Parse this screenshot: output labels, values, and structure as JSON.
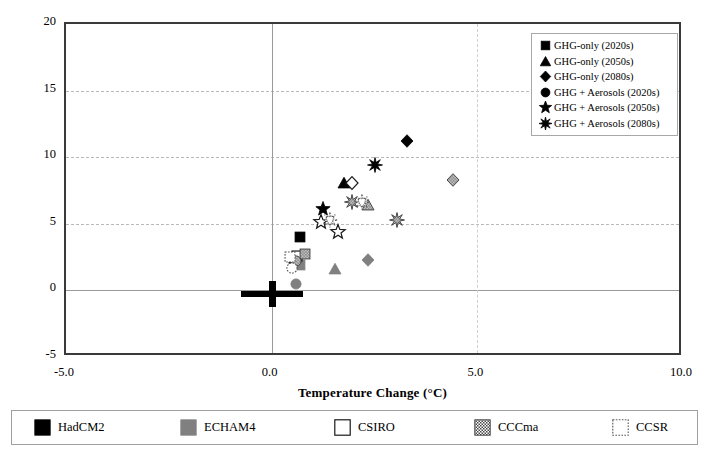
{
  "chart_data": {
    "type": "scatter",
    "title": "",
    "xlabel": "Temperature Change (°C)",
    "ylabel": "Precipitation Change (%)",
    "xlim": [
      -5.0,
      10.0
    ],
    "ylim": [
      -5,
      20
    ],
    "xticks": [
      "-5.0",
      "0.0",
      "5.0",
      "10.0"
    ],
    "xtick_values": [
      -5.0,
      0.0,
      5.0,
      10.0
    ],
    "yticks": [
      "-5",
      "0",
      "5",
      "10",
      "15",
      "20"
    ],
    "ytick_values": [
      -5,
      0,
      5,
      10,
      15,
      20
    ],
    "grid": "dashed horizontal and vertical gridlines",
    "legend_position": "inside top-right",
    "baseline_marker": {
      "label": "baseline cross",
      "x": 0.0,
      "y": -0.3
    },
    "points": [
      {
        "model": "HadCM2",
        "scenario": "GHG-only (2020s)",
        "marker": "square",
        "fill": "black",
        "x": 0.7,
        "y": 4.0
      },
      {
        "model": "HadCM2",
        "scenario": "GHG-only (2050s)",
        "marker": "triangle",
        "fill": "black",
        "x": 1.75,
        "y": 8.1
      },
      {
        "model": "HadCM2",
        "scenario": "GHG-only (2080s)",
        "marker": "diamond",
        "fill": "black",
        "x": 3.3,
        "y": 11.2
      },
      {
        "model": "HadCM2",
        "scenario": "GHG + Aerosols (2020s)",
        "marker": "circle",
        "fill": "black",
        "x": 0.55,
        "y": 2.1
      },
      {
        "model": "HadCM2",
        "scenario": "GHG + Aerosols (2050s)",
        "marker": "star5",
        "fill": "black",
        "x": 1.25,
        "y": 6.1
      },
      {
        "model": "HadCM2",
        "scenario": "GHG + Aerosols (2080s)",
        "marker": "star8",
        "fill": "black",
        "x": 2.5,
        "y": 9.4
      },
      {
        "model": "ECHAM4",
        "scenario": "GHG-only (2020s)",
        "marker": "square",
        "fill": "gray",
        "x": 0.68,
        "y": 1.9
      },
      {
        "model": "ECHAM4",
        "scenario": "GHG-only (2050s)",
        "marker": "triangle",
        "fill": "gray",
        "x": 1.55,
        "y": 1.6
      },
      {
        "model": "ECHAM4",
        "scenario": "GHG-only (2080s)",
        "marker": "diamond",
        "fill": "gray",
        "x": 2.35,
        "y": 2.3
      },
      {
        "model": "ECHAM4",
        "scenario": "GHG + Aerosols (2020s)",
        "marker": "circle",
        "fill": "gray",
        "x": 0.6,
        "y": 0.5
      },
      {
        "model": "CSIRO",
        "scenario": "GHG-only (2020s)",
        "marker": "square",
        "fill": "white",
        "x": 0.62,
        "y": 2.6
      },
      {
        "model": "CSIRO",
        "scenario": "GHG-only (2080s)",
        "marker": "diamond",
        "fill": "white",
        "x": 1.95,
        "y": 8.1
      },
      {
        "model": "CSIRO",
        "scenario": "GHG + Aerosols (2050s)",
        "marker": "star5",
        "fill": "white",
        "x": 1.2,
        "y": 5.1
      },
      {
        "model": "CSIRO",
        "scenario": "GHG + Aerosols (2080s)",
        "marker": "star5",
        "fill": "white",
        "x": 1.62,
        "y": 4.4
      },
      {
        "model": "CCCma",
        "scenario": "GHG-only (2020s)",
        "marker": "square",
        "fill": "check",
        "x": 0.8,
        "y": 2.7
      },
      {
        "model": "CCCma",
        "scenario": "GHG-only (2050s)",
        "marker": "triangle",
        "fill": "check",
        "x": 2.35,
        "y": 6.4
      },
      {
        "model": "CCCma",
        "scenario": "GHG-only (2080s)",
        "marker": "diamond",
        "fill": "check",
        "x": 4.4,
        "y": 8.3
      },
      {
        "model": "CCCma",
        "scenario": "GHG + Aerosols (2020s)",
        "marker": "circle",
        "fill": "check",
        "x": 0.58,
        "y": 2.2
      },
      {
        "model": "CCCma",
        "scenario": "GHG + Aerosols (2050s)",
        "marker": "star8",
        "fill": "check",
        "x": 1.95,
        "y": 6.6
      },
      {
        "model": "CCCma",
        "scenario": "GHG + Aerosols (2080s)",
        "marker": "star8",
        "fill": "check",
        "x": 3.05,
        "y": 5.3
      },
      {
        "model": "CCSR",
        "scenario": "GHG-only (2020s)",
        "marker": "square",
        "fill": "dot",
        "x": 0.45,
        "y": 2.5
      },
      {
        "model": "CCSR",
        "scenario": "GHG + Aerosols (2020s)",
        "marker": "circle",
        "fill": "dot",
        "x": 0.5,
        "y": 1.7
      },
      {
        "model": "CCSR",
        "scenario": "GHG + Aerosols (2050s)",
        "marker": "star8",
        "fill": "dot",
        "x": 1.42,
        "y": 5.3
      },
      {
        "model": "CCSR",
        "scenario": "GHG + Aerosols (2080s)",
        "marker": "star8",
        "fill": "dot",
        "x": 2.2,
        "y": 6.6
      }
    ],
    "series_legend": [
      {
        "marker": "square",
        "label": "GHG-only (2020s)"
      },
      {
        "marker": "triangle",
        "label": "GHG-only (2050s)"
      },
      {
        "marker": "diamond",
        "label": "GHG-only (2080s)"
      },
      {
        "marker": "circle",
        "label": "GHG + Aerosols (2020s)"
      },
      {
        "marker": "star5",
        "label": "GHG + Aerosols (2050s)"
      },
      {
        "marker": "star8",
        "label": "GHG + Aerosols (2080s)"
      }
    ],
    "model_legend": [
      {
        "label": "HadCM2",
        "fill": "black",
        "color": "#000000"
      },
      {
        "label": "ECHAM4",
        "fill": "gray",
        "color": "#808080"
      },
      {
        "label": "CSIRO",
        "fill": "white",
        "color": "#ffffff"
      },
      {
        "label": "CCCma",
        "fill": "check",
        "color": "#555555"
      },
      {
        "label": "CCSR",
        "fill": "dot",
        "color": "#ffffff"
      }
    ]
  }
}
